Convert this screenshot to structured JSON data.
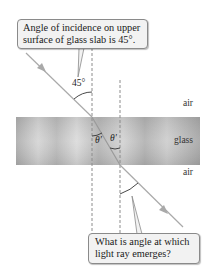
{
  "figure": {
    "callout_top": {
      "line1": "Angle of incidence on upper",
      "line2": "surface of glass slab is 45°."
    },
    "callout_bottom": {
      "line1": "What is angle at which",
      "line2": "light ray emerges?"
    },
    "angle_incident_label": "45°",
    "refracted_angle_left_label": "θ′",
    "refracted_angle_right_label": "θ′",
    "media": {
      "upper": "air",
      "middle": "glass",
      "lower": "air"
    },
    "colors": {
      "ray": "#a9a9a9",
      "normal_line": "#8c8c8c",
      "glass_light": "#d9d9d9",
      "glass_dark": "#a8a8a8",
      "callout_bg": "#f2f2f2",
      "callout_border": "#8a8a8a"
    }
  }
}
